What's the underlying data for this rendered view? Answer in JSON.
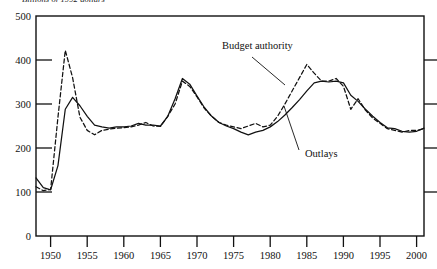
{
  "figure": {
    "subtitle": "Billions of 1992 dollars",
    "background_color": "#ffffff",
    "ink_color": "#111111"
  },
  "annotations": {
    "budget_authority": {
      "label": "Budget authority",
      "x": 222,
      "y": 49
    },
    "outlays": {
      "label": "Outlays",
      "x": 305,
      "y": 157
    }
  },
  "axes": {
    "y_label_0": "0",
    "y_label_100": "100",
    "y_label_200": "200",
    "y_label_300": "300",
    "y_label_400": "400",
    "y_label_500": "500",
    "x_label_1950": "1950",
    "x_label_1955": "1955",
    "x_label_1960": "1960",
    "x_label_1965": "1965",
    "x_label_1970": "1970",
    "x_label_1975": "1975",
    "x_label_1980": "1980",
    "x_label_1985": "1985",
    "x_label_1990": "1990",
    "x_label_1995": "1995",
    "x_label_2000": "2000"
  },
  "chart_data": {
    "type": "line",
    "title": "",
    "subtitle": "Billions of 1992 dollars",
    "xlabel": "",
    "ylabel": "Billions of 1992 dollars",
    "xlim": [
      1948,
      2001
    ],
    "ylim": [
      0,
      500
    ],
    "yticks": [
      0,
      100,
      200,
      300,
      400,
      500
    ],
    "xticks": [
      1950,
      1955,
      1960,
      1965,
      1970,
      1975,
      1980,
      1985,
      1990,
      1995,
      2000
    ],
    "grid": false,
    "legend_position": "inline-annotations",
    "x": [
      1948,
      1949,
      1950,
      1951,
      1952,
      1953,
      1954,
      1955,
      1956,
      1957,
      1958,
      1959,
      1960,
      1961,
      1962,
      1963,
      1964,
      1965,
      1966,
      1967,
      1968,
      1969,
      1970,
      1971,
      1972,
      1973,
      1974,
      1975,
      1976,
      1977,
      1978,
      1979,
      1980,
      1981,
      1982,
      1983,
      1984,
      1985,
      1986,
      1987,
      1988,
      1989,
      1990,
      1991,
      1992,
      1993,
      1994,
      1995,
      1996,
      1997,
      1998,
      1999,
      2000,
      2001
    ],
    "series": [
      {
        "name": "Budget authority",
        "style": "dashed",
        "color": "#111111",
        "values": [
          112,
          103,
          106,
          270,
          422,
          360,
          270,
          240,
          230,
          240,
          243,
          245,
          246,
          248,
          252,
          258,
          250,
          249,
          272,
          300,
          352,
          340,
          316,
          290,
          272,
          258,
          252,
          248,
          244,
          250,
          256,
          248,
          252,
          272,
          300,
          330,
          360,
          390,
          370,
          352,
          352,
          358,
          340,
          288,
          312,
          286,
          268,
          256,
          244,
          240,
          236,
          240,
          240,
          244
        ],
        "annotation": {
          "text": "Budget authority",
          "points_to_year": 1983,
          "points_to_value": 300
        }
      },
      {
        "name": "Outlays",
        "style": "solid",
        "color": "#111111",
        "values": [
          132,
          110,
          105,
          160,
          288,
          315,
          296,
          272,
          252,
          248,
          245,
          248,
          248,
          250,
          256,
          252,
          252,
          250,
          272,
          312,
          358,
          345,
          318,
          292,
          272,
          258,
          250,
          244,
          236,
          230,
          236,
          240,
          248,
          260,
          275,
          292,
          310,
          330,
          348,
          352,
          350,
          352,
          348,
          320,
          306,
          288,
          272,
          258,
          246,
          244,
          238,
          236,
          238,
          245
        ],
        "annotation": {
          "text": "Outlays",
          "points_to_year": 1983,
          "points_to_value": 300
        }
      }
    ]
  }
}
